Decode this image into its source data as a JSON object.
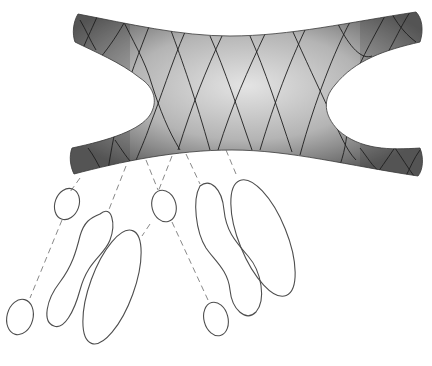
{
  "figure": {
    "colors": {
      "background": "#ffffff",
      "surface_dark": "#5a5a5a",
      "surface_light": "#d8d8d8",
      "mesh_line": "#222222",
      "loop_line": "#555555",
      "dash_line": "#666666"
    },
    "surface": {
      "label": ""
    },
    "loops": [
      {
        "id": "loop-1",
        "type": "small-ellipse"
      },
      {
        "id": "loop-2",
        "type": "peanut"
      },
      {
        "id": "loop-3",
        "type": "small-ellipse"
      },
      {
        "id": "loop-4",
        "type": "peanut"
      },
      {
        "id": "loop-5",
        "type": "large-ellipse"
      },
      {
        "id": "loop-6",
        "type": "small-ellipse"
      },
      {
        "id": "loop-7",
        "type": "large-ellipse"
      },
      {
        "id": "loop-8",
        "type": "small-ellipse"
      }
    ]
  }
}
